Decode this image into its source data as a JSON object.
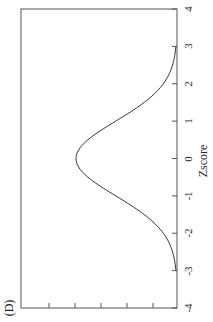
{
  "panel_label": "(D)",
  "chart_data": {
    "type": "line",
    "orientation": "rotated-90-ccw",
    "title": "",
    "panel_label": "(D)",
    "xlabel": "Zscore",
    "ylabel": "",
    "xlim": [
      -4,
      4
    ],
    "x_ticks": [
      "-4",
      "-3",
      "-2",
      "-1",
      "0",
      "1",
      "2",
      "3",
      "4"
    ],
    "y_tick_count": 5,
    "grid": false,
    "legend": null,
    "series": [
      {
        "name": "normal density",
        "x": [
          -3,
          -2.5,
          -2,
          -1.5,
          -1,
          -0.5,
          0,
          0.5,
          1,
          1.5,
          2,
          2.5,
          3
        ],
        "values": [
          0.004,
          0.018,
          0.054,
          0.13,
          0.242,
          0.352,
          0.399,
          0.352,
          0.242,
          0.13,
          0.054,
          0.018,
          0.004
        ]
      }
    ],
    "colors": {
      "line": "#333333",
      "axes": "#555555"
    }
  }
}
